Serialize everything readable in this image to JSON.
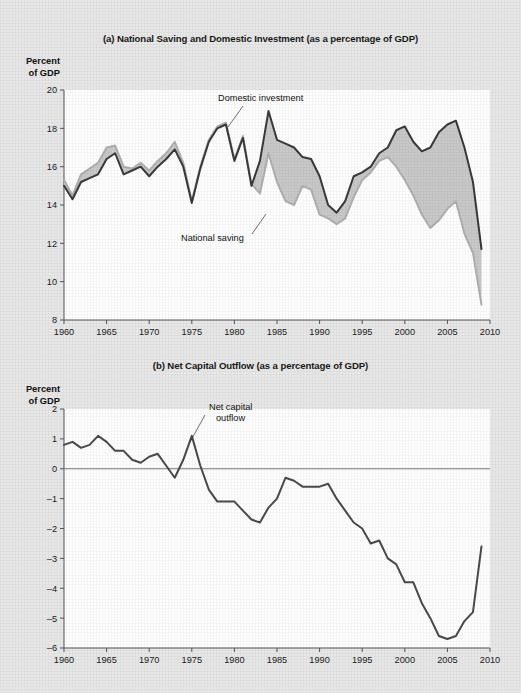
{
  "figure": {
    "background_color": "#e8e8e8",
    "plot_background_color": "#ffffff"
  },
  "panel_a": {
    "title": "(a) National Saving and Domestic Investment (as a percentage of GDP)",
    "axis_caption_line1": "Percent",
    "axis_caption_line2": "of GDP",
    "annotation_investment": "Domestic investment",
    "annotation_saving": "National saving"
  },
  "panel_b": {
    "title": "(b) Net Capital Outflow (as a percentage of GDP)",
    "axis_caption_line1": "Percent",
    "axis_caption_line2": "of GDP",
    "annotation_nco_line1": "Net capital",
    "annotation_nco_line2": "outflow"
  },
  "chart_data": [
    {
      "type": "line",
      "panel": "a",
      "title": "(a) National Saving and Domestic Investment (as a percentage of GDP)",
      "xlabel": "",
      "ylabel": "Percent of GDP",
      "xlim": [
        1960,
        2010
      ],
      "ylim": [
        8,
        20
      ],
      "xticks": [
        1960,
        1965,
        1970,
        1975,
        1980,
        1985,
        1990,
        1995,
        2000,
        2005,
        2010
      ],
      "yticks": [
        8,
        10,
        12,
        14,
        16,
        18,
        20
      ],
      "grid": false,
      "legend": "inline-annotations",
      "shaded_gap": true,
      "gap_color": "#c9c9c9",
      "x": [
        1960,
        1961,
        1962,
        1963,
        1964,
        1965,
        1966,
        1967,
        1968,
        1969,
        1970,
        1971,
        1972,
        1973,
        1974,
        1975,
        1976,
        1977,
        1978,
        1979,
        1980,
        1981,
        1982,
        1983,
        1984,
        1985,
        1986,
        1987,
        1988,
        1989,
        1990,
        1991,
        1992,
        1993,
        1994,
        1995,
        1996,
        1997,
        1998,
        1999,
        2000,
        2001,
        2002,
        2003,
        2004,
        2005,
        2006,
        2007,
        2008,
        2009
      ],
      "series": [
        {
          "name": "Domestic investment",
          "color": "#3a3a3a",
          "values": [
            15.0,
            14.3,
            15.2,
            15.4,
            15.6,
            16.4,
            16.7,
            15.6,
            15.8,
            16.0,
            15.5,
            16.0,
            16.4,
            16.9,
            16.0,
            14.1,
            15.9,
            17.3,
            18.0,
            18.2,
            16.3,
            17.5,
            15.0,
            16.3,
            18.9,
            17.4,
            17.2,
            17.0,
            16.5,
            16.4,
            15.5,
            14.0,
            13.6,
            14.2,
            15.5,
            15.7,
            16.0,
            16.7,
            17.0,
            17.9,
            18.1,
            17.3,
            16.8,
            17.0,
            17.8,
            18.2,
            18.4,
            17.0,
            15.2,
            11.7
          ]
        },
        {
          "name": "National saving",
          "color": "#b0b0b0",
          "values": [
            15.3,
            14.5,
            15.6,
            15.9,
            16.2,
            17.0,
            17.1,
            16.0,
            15.9,
            16.2,
            15.8,
            16.3,
            16.7,
            17.3,
            16.2,
            14.2,
            16.0,
            17.4,
            18.1,
            18.3,
            16.4,
            17.6,
            15.1,
            14.6,
            16.7,
            15.2,
            14.2,
            14.0,
            15.0,
            14.8,
            13.5,
            13.3,
            13.0,
            13.3,
            14.4,
            15.3,
            15.7,
            16.3,
            16.5,
            16.0,
            15.3,
            14.5,
            13.5,
            12.8,
            13.2,
            13.8,
            14.2,
            12.5,
            11.5,
            8.8
          ]
        }
      ],
      "annotations": [
        {
          "text": "Domestic investment",
          "x": 1982,
          "y": 19.3
        },
        {
          "text": "National saving",
          "x": 1984,
          "y": 12.4
        }
      ]
    },
    {
      "type": "line",
      "panel": "b",
      "title": "(b) Net Capital Outflow (as a percentage of GDP)",
      "xlabel": "",
      "ylabel": "Percent of GDP",
      "xlim": [
        1960,
        2010
      ],
      "ylim": [
        -6,
        2
      ],
      "xticks": [
        1960,
        1965,
        1970,
        1975,
        1980,
        1985,
        1990,
        1995,
        2000,
        2005,
        2010
      ],
      "yticks": [
        -6,
        -5,
        -4,
        -3,
        -2,
        -1,
        0,
        1,
        2
      ],
      "grid": false,
      "zero_line": true,
      "x": [
        1960,
        1961,
        1962,
        1963,
        1964,
        1965,
        1966,
        1967,
        1968,
        1969,
        1970,
        1971,
        1972,
        1973,
        1974,
        1975,
        1976,
        1977,
        1978,
        1979,
        1980,
        1981,
        1982,
        1983,
        1984,
        1985,
        1986,
        1987,
        1988,
        1989,
        1990,
        1991,
        1992,
        1993,
        1994,
        1995,
        1996,
        1997,
        1998,
        1999,
        2000,
        2001,
        2002,
        2003,
        2004,
        2005,
        2006,
        2007,
        2008,
        2009
      ],
      "series": [
        {
          "name": "Net capital outflow",
          "color": "#4a4a4a",
          "values": [
            0.8,
            0.9,
            0.7,
            0.8,
            1.1,
            0.9,
            0.6,
            0.6,
            0.3,
            0.2,
            0.4,
            0.5,
            0.1,
            -0.3,
            0.3,
            1.1,
            0.1,
            -0.7,
            -1.1,
            -1.1,
            -1.1,
            -1.4,
            -1.7,
            -1.8,
            -1.3,
            -1.0,
            -0.3,
            -0.4,
            -0.6,
            -0.6,
            -0.6,
            -0.5,
            -1.0,
            -1.4,
            -1.8,
            -2.0,
            -2.5,
            -2.4,
            -3.0,
            -3.2,
            -3.8,
            -3.8,
            -4.5,
            -5.0,
            -5.6,
            -5.7,
            -5.6,
            -5.1,
            -4.8,
            -2.6
          ]
        }
      ],
      "annotations": [
        {
          "text": "Net capital outflow",
          "x": 1977,
          "y": 1.7
        }
      ]
    }
  ]
}
